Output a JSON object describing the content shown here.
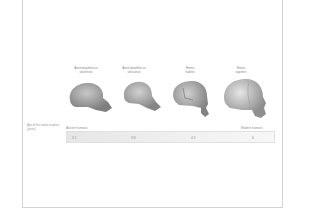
{
  "figure": {
    "species": [
      {
        "genus": "Australopithecus",
        "species": "afarensis"
      },
      {
        "genus": "Australopithecus",
        "species": "africanus"
      },
      {
        "genus": "Homo",
        "species": "habilis"
      },
      {
        "genus": "Homo",
        "species": "sapiens"
      }
    ],
    "row_label": "Age of first molar eruption (years)",
    "bar": {
      "start_label": "Ancient humans",
      "end_label": "Modern humans",
      "values": [
        "3.1",
        "3.8",
        "4.5",
        "6"
      ]
    }
  },
  "colors": {
    "frame": "#d4d4d4",
    "skull": "#9a9a9a",
    "bar": "#e8e8e8"
  }
}
